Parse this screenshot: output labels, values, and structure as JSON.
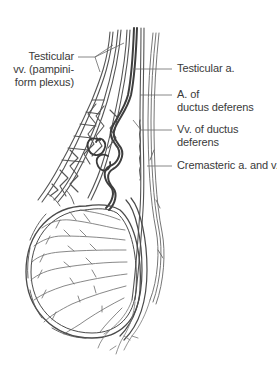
{
  "figure": {
    "colors": {
      "background": "#ffffff",
      "line": "#555555",
      "vessel_dark": "#4a4a4a",
      "vessel_light": "#8a8a8a",
      "label_text": "#3a3a3a",
      "leader": "#6a6a6a"
    },
    "labels": [
      {
        "id": "testicular-veins",
        "lines": [
          "Testicular",
          "vv. (pampini-",
          "form plexus)"
        ],
        "side": "left"
      },
      {
        "id": "testicular-artery",
        "lines": [
          "Testicular a."
        ],
        "side": "right"
      },
      {
        "id": "artery-of-ductus-deferens",
        "lines": [
          "A. of",
          "ductus deferens"
        ],
        "side": "right"
      },
      {
        "id": "veins-of-ductus-deferens",
        "lines": [
          "Vv. of ductus",
          "deferens"
        ],
        "side": "right"
      },
      {
        "id": "cremasteric-artery-and-vein",
        "lines": [
          "Cremasteric a. and v."
        ],
        "side": "right"
      }
    ]
  }
}
